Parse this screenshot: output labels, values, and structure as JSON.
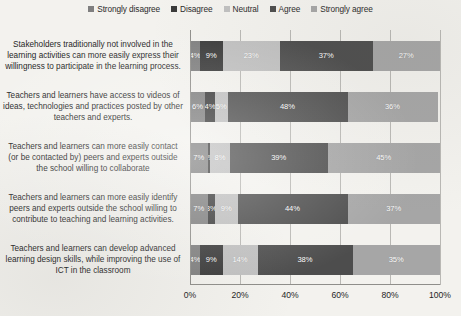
{
  "chart_data": {
    "type": "bar",
    "subtype": "stacked-horizontal-100-percent",
    "title": "",
    "xlabel": "",
    "ylabel": "",
    "xlim": [
      0,
      100
    ],
    "xticks": [
      "0%",
      "20%",
      "40%",
      "60%",
      "80%",
      "100%"
    ],
    "xtick_values": [
      0,
      20,
      40,
      60,
      80,
      100
    ],
    "grid": true,
    "legend_position": "top-center",
    "categories": [
      "Stakeholders traditionally not involved in the learning activities can more easily express their willingness to participate in the learning process.",
      "Teachers and learners have access to videos of ideas, technologies and practices posted by other teachers and experts.",
      "Teachers and learners can more easily contact (or be contacted by) peers and experts outside the school willing to collaborate",
      "Teachers and learners can more easily identify peers and experts outside the school willing to contribute to teaching and learning activities.",
      "Teachers and learners can develop advanced learning design skills, while improving the use of ICT in the classroom"
    ],
    "category_lines": [
      [
        "Stakeholders traditionally not involved in the",
        "learning activities can more easily express their",
        "willingness to participate in the learning process."
      ],
      [
        "Teachers and learners have access to videos of",
        "ideas, technologies and practices posted by other",
        "teachers and experts."
      ],
      [
        "Teachers and learners can more easily contact",
        "(or be contacted by) peers and experts outside",
        "the school willing to collaborate"
      ],
      [
        "Teachers and learners can more easily identify",
        "peers and experts outside the school willing to",
        "contribute to teaching and learning activities."
      ],
      [
        "Teachers and learners can develop advanced",
        "learning design skills, while improving the use of",
        "ICT in the classroom"
      ]
    ],
    "series": [
      {
        "name": "Strongly disagree",
        "color": "#7f7f7f",
        "values": [
          4,
          6,
          7,
          7,
          4
        ]
      },
      {
        "name": "Disagree",
        "color": "#3a3a3a",
        "values": [
          9,
          4,
          1,
          3,
          9
        ]
      },
      {
        "name": "Neutral",
        "color": "#c0c0c0",
        "values": [
          23,
          5,
          8,
          9,
          14
        ]
      },
      {
        "name": "Agree",
        "color": "#4d4d4d",
        "values": [
          37,
          48,
          39,
          44,
          38
        ]
      },
      {
        "name": "Strongly agree",
        "color": "#a6a6a6",
        "values": [
          27,
          36,
          45,
          37,
          35
        ]
      }
    ],
    "labels": [
      [
        "4%",
        "9%",
        "23%",
        "37%",
        "27%"
      ],
      [
        "6%",
        "4%",
        "5%",
        "48%",
        "36%"
      ],
      [
        "7%",
        "1%",
        "8%",
        "39%",
        "45%"
      ],
      [
        "7%",
        "3%",
        "9%",
        "44%",
        "37%"
      ],
      [
        "4%",
        "9%",
        "14%",
        "38%",
        "35%"
      ]
    ]
  }
}
